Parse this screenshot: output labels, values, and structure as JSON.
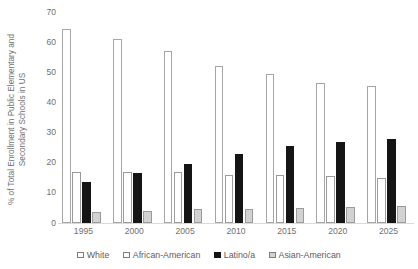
{
  "chart_data": {
    "type": "bar",
    "title": "",
    "subtitle": "",
    "xlabel": "",
    "ylabel": "% of Total Enrollment in Public Elementary and Secondary Schools in US",
    "ylabel_line1": "% of Total Enrollment in Public Elementary and",
    "ylabel_line2": "Secondary Schools in US",
    "categories": [
      "1995",
      "2000",
      "2005",
      "2010",
      "2015",
      "2020",
      "2025"
    ],
    "ylim": [
      0,
      70
    ],
    "yticks": [
      0,
      10,
      20,
      30,
      40,
      50,
      60,
      70
    ],
    "ytick_labels": [
      "0",
      "10",
      "20",
      "30",
      "40",
      "50",
      "60",
      "70"
    ],
    "grid": false,
    "legend_position": "bottom",
    "series": [
      {
        "name": "White",
        "color": "#ffffff",
        "border_color": "#a6a6a6",
        "values": [
          64.5,
          61,
          57,
          52,
          49.5,
          46.5,
          45.5
        ]
      },
      {
        "name": "African-American",
        "color": "#ffffff",
        "border_color": "#9b9b9b",
        "values": [
          17,
          17,
          17,
          16,
          15.8,
          15.5,
          15
        ]
      },
      {
        "name": "Latino/a",
        "color": "#151515",
        "border_color": "#151515",
        "values": [
          13.5,
          16.5,
          19.5,
          23,
          25.5,
          27,
          28
        ]
      },
      {
        "name": "Asian-American",
        "color": "#d2d2d2",
        "border_color": "#9b9b9b",
        "values": [
          3.8,
          4,
          4.5,
          4.8,
          5,
          5.2,
          5.5
        ]
      }
    ]
  }
}
